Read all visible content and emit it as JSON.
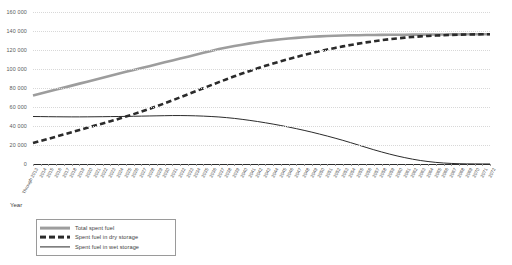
{
  "chart_data": {
    "type": "line",
    "title": "",
    "xlabel": "Year",
    "ylabel": "",
    "ylim": [
      0,
      160000
    ],
    "ytick_step": 20000,
    "yticks": [
      "0",
      "20 000",
      "40 000",
      "60 000",
      "80 000",
      "100 000",
      "120 000",
      "140 000",
      "160 000"
    ],
    "grid": true,
    "legend_position": "bottom-left",
    "categories": [
      "Through 2013",
      "2014",
      "2015",
      "2016",
      "2017",
      "2018",
      "2019",
      "2020",
      "2021",
      "2022",
      "2023",
      "2024",
      "2025",
      "2026",
      "2027",
      "2028",
      "2029",
      "2030",
      "2031",
      "2032",
      "2033",
      "2034",
      "2035",
      "2036",
      "2037",
      "2038",
      "2039",
      "2040",
      "2041",
      "2042",
      "2043",
      "2044",
      "2045",
      "2046",
      "2047",
      "2048",
      "2049",
      "2050",
      "2051",
      "2052",
      "2053",
      "2054",
      "2055",
      "2056",
      "2057",
      "2058",
      "2059",
      "2060",
      "2061",
      "2062",
      "2063",
      "2064",
      "2065",
      "2066",
      "2067",
      "2068",
      "2069",
      "2070",
      "2071",
      "2072"
    ],
    "series": [
      {
        "name": "Total spent fuel",
        "style": "solid-thick-gray",
        "color": "#9d9d9d",
        "values": [
          72000,
          74100,
          76200,
          78300,
          80400,
          82500,
          84600,
          86700,
          88800,
          90900,
          93000,
          95000,
          97000,
          99000,
          101000,
          103000,
          105000,
          107000,
          109000,
          111000,
          113000,
          115000,
          117000,
          119000,
          121000,
          122600,
          124200,
          125600,
          127000,
          128200,
          129400,
          130400,
          131300,
          132100,
          132800,
          133400,
          133900,
          134300,
          134700,
          135000,
          135250,
          135450,
          135600,
          135750,
          135850,
          135950,
          136000,
          136050,
          136100,
          136150,
          136200,
          136250,
          136300,
          136350,
          136400,
          136450,
          136500,
          136550,
          136600,
          136650
        ]
      },
      {
        "name": "Spent fuel in dry storage",
        "style": "dashed-thick-dark",
        "color": "#2b2b2b",
        "values": [
          22000,
          24300,
          26600,
          28900,
          31200,
          33500,
          35800,
          38100,
          40400,
          42700,
          45000,
          47400,
          49900,
          52500,
          55200,
          58000,
          60900,
          63900,
          67000,
          70200,
          73400,
          76600,
          79800,
          83000,
          86200,
          89300,
          92300,
          95200,
          98000,
          100700,
          103300,
          105800,
          108200,
          110500,
          112700,
          114800,
          116800,
          118700,
          120500,
          122200,
          123800,
          125300,
          126700,
          128000,
          129200,
          130300,
          131300,
          132200,
          133000,
          133700,
          134300,
          134800,
          135200,
          135550,
          135850,
          136100,
          136300,
          136450,
          136550,
          136650
        ]
      },
      {
        "name": "Spent fuel in wet storage",
        "style": "solid-thin-dark",
        "color": "#2b2b2b",
        "values": [
          50000,
          49900,
          49800,
          49700,
          49650,
          49600,
          49600,
          49650,
          49700,
          49800,
          49900,
          50000,
          50100,
          50250,
          50400,
          50550,
          50700,
          50850,
          51000,
          51000,
          50900,
          50700,
          50400,
          50000,
          49500,
          48800,
          48000,
          47000,
          45900,
          44700,
          43400,
          42000,
          40500,
          38900,
          37200,
          35400,
          33500,
          31500,
          29400,
          27200,
          24900,
          22500,
          20000,
          17500,
          15000,
          12700,
          10500,
          8500,
          6700,
          5100,
          3700,
          2600,
          1700,
          1050,
          600,
          300,
          150,
          80,
          40,
          20
        ]
      }
    ]
  },
  "legend": {
    "items": [
      {
        "label": "Total spent fuel",
        "swatch": "sw-total"
      },
      {
        "label": "Spent fuel in dry storage",
        "swatch": "sw-dry"
      },
      {
        "label": "Spent fuel in wet storage",
        "swatch": "sw-wet"
      }
    ]
  },
  "axis": {
    "x_title": "Year"
  },
  "colors": {
    "total": "#9d9d9d",
    "dry": "#2b2b2b",
    "wet": "#2b2b2b",
    "grid": "#d8d8d8",
    "axis": "#2d2d2d"
  }
}
